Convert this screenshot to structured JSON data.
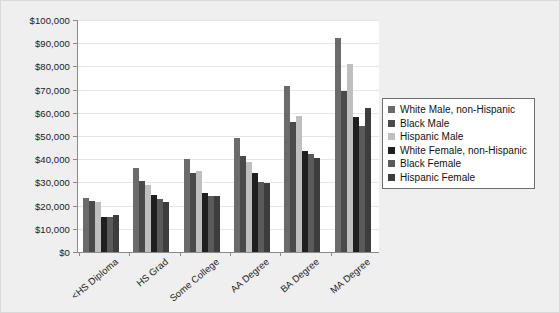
{
  "chart_data": {
    "type": "bar",
    "title": "",
    "subtitle": "",
    "xlabel": "",
    "ylabel": "",
    "ylim": [
      0,
      100000
    ],
    "ytick_step": 10000,
    "grid": true,
    "legend_position": "right",
    "categories": [
      "<HS Diploma",
      "HS Grad",
      "Some College",
      "AA Degree",
      "BA Degree",
      "MA Degree"
    ],
    "ytick_labels": [
      "$100,000",
      "$90,000",
      "$80,000",
      "$70,000",
      "$60,000",
      "$50,000",
      "$40,000",
      "$30,000",
      "$20,000",
      "$10,000",
      "$0"
    ],
    "ytick_values": [
      100000,
      90000,
      80000,
      70000,
      60000,
      50000,
      40000,
      30000,
      20000,
      10000,
      0
    ],
    "series": [
      {
        "name": "White Male, non-Hispanic",
        "color": "#6b6b6b",
        "values": [
          23300,
          36400,
          40200,
          49000,
          71400,
          92100
        ]
      },
      {
        "name": "Black Male",
        "color": "#4a4a4a",
        "values": [
          21800,
          30800,
          34000,
          41300,
          56000,
          69200
        ]
      },
      {
        "name": "Hispanic Male",
        "color": "#bfbfbf",
        "values": [
          21700,
          28900,
          34800,
          38900,
          58600,
          81000
        ]
      },
      {
        "name": "White Female, non-Hispanic",
        "color": "#1f1f1f",
        "values": [
          15000,
          24700,
          25400,
          34200,
          43400,
          58400
        ]
      },
      {
        "name": "Black Female",
        "color": "#5a5a5a",
        "values": [
          15200,
          22800,
          24300,
          30000,
          42300,
          54400
        ]
      },
      {
        "name": "Hispanic Female",
        "color": "#3d3d3d",
        "values": [
          16100,
          21600,
          24000,
          29900,
          40400,
          62000
        ]
      }
    ]
  },
  "legend": {
    "items": [
      {
        "label": "White Male, non-Hispanic",
        "color": "#6b6b6b"
      },
      {
        "label": "Black Male",
        "color": "#4a4a4a"
      },
      {
        "label": "Hispanic Male",
        "color": "#bfbfbf"
      },
      {
        "label": "White Female, non-Hispanic",
        "color": "#1f1f1f"
      },
      {
        "label": "Black Female",
        "color": "#5a5a5a"
      },
      {
        "label": "Hispanic Female",
        "color": "#3d3d3d"
      }
    ]
  },
  "theme": {
    "page_background": "#efeff0",
    "plot_background": "#ffffff",
    "axis_color": "#8a8a8a",
    "grid_color": "#e6e6e6",
    "text_color": "#1a1a1a"
  }
}
